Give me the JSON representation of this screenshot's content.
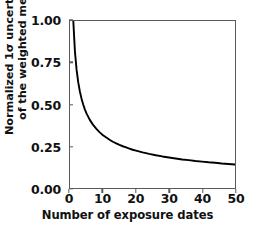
{
  "chart_data": {
    "type": "line",
    "title": "",
    "subtitle": "",
    "xlabel": "Number of exposure dates",
    "ylabel_line1": "Normalized 1σ uncertainty",
    "ylabel_line2": "of the weighted mean",
    "xlim": [
      0,
      50
    ],
    "ylim": [
      0.0,
      1.0
    ],
    "xticks": [
      0,
      10,
      20,
      30,
      40,
      50
    ],
    "xtick_labels": [
      "0",
      "10",
      "20",
      "30",
      "40",
      "50"
    ],
    "yticks": [
      0.0,
      0.25,
      0.5,
      0.75,
      1.0
    ],
    "ytick_labels": [
      "0.00",
      "0.25",
      "0.50",
      "0.75",
      "1.00"
    ],
    "grid": false,
    "legend": null,
    "annotations": [],
    "series": [
      {
        "name": "Normalized 1σ uncertainty of the weighted mean",
        "color": "#000000",
        "line_width": 1.8,
        "x": [
          1,
          1.5,
          2,
          2.5,
          3,
          3.5,
          4,
          4.5,
          5,
          6,
          7,
          8,
          9,
          10,
          11,
          12,
          13,
          14,
          15,
          16,
          17,
          18,
          19,
          20,
          22,
          24,
          26,
          28,
          30,
          32,
          34,
          36,
          38,
          40,
          42,
          44,
          46,
          48,
          50
        ],
        "y": [
          1.0,
          0.816,
          0.707,
          0.632,
          0.577,
          0.535,
          0.5,
          0.471,
          0.447,
          0.408,
          0.378,
          0.354,
          0.333,
          0.316,
          0.302,
          0.289,
          0.277,
          0.267,
          0.258,
          0.25,
          0.243,
          0.236,
          0.229,
          0.224,
          0.213,
          0.204,
          0.196,
          0.189,
          0.183,
          0.177,
          0.171,
          0.167,
          0.162,
          0.158,
          0.154,
          0.151,
          0.147,
          0.144,
          0.141
        ]
      }
    ]
  },
  "figure": {
    "background_color": "#ffffff",
    "axis_color": "#5a5a5a",
    "text_color": "#111111"
  }
}
